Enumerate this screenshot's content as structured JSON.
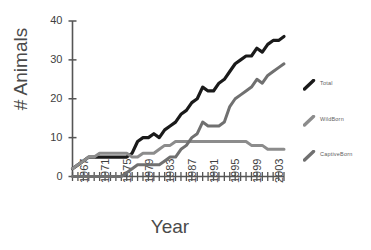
{
  "chart_data": {
    "type": "line",
    "title": "",
    "xlabel": "Year",
    "ylabel": "# Animals",
    "xlim": [
      1967,
      2006
    ],
    "ylim": [
      0,
      40
    ],
    "yticks": [
      0,
      10,
      20,
      30,
      40
    ],
    "xticks_labeled": [
      1967,
      1971,
      1975,
      1979,
      1983,
      1987,
      1991,
      1995,
      1999,
      2003
    ],
    "grid": false,
    "legend_position": "right",
    "x": [
      1967,
      1968,
      1969,
      1970,
      1971,
      1972,
      1973,
      1974,
      1975,
      1976,
      1977,
      1978,
      1979,
      1980,
      1981,
      1982,
      1983,
      1984,
      1985,
      1986,
      1987,
      1988,
      1989,
      1990,
      1991,
      1992,
      1993,
      1994,
      1995,
      1996,
      1997,
      1998,
      1999,
      2000,
      2001,
      2002,
      2003,
      2004,
      2005,
      2006
    ],
    "series": [
      {
        "name": "Total",
        "color": "#1a1a1a",
        "values": [
          2,
          3,
          4,
          5,
          5,
          5,
          5,
          5,
          5,
          5,
          5,
          6,
          9,
          10,
          10,
          11,
          10,
          12,
          13,
          14,
          16,
          17,
          19,
          20,
          23,
          22,
          22,
          24,
          25,
          27,
          29,
          30,
          31,
          31,
          33,
          32,
          34,
          35,
          35,
          36
        ]
      },
      {
        "name": "WildBorn",
        "color": "#8c8c8c",
        "values": [
          2,
          3,
          4,
          5,
          5,
          6,
          6,
          6,
          6,
          6,
          6,
          5,
          5,
          6,
          6,
          6,
          7,
          8,
          8,
          9,
          9,
          9,
          9,
          9,
          9,
          9,
          9,
          9,
          9,
          9,
          9,
          9,
          9,
          8,
          8,
          8,
          7,
          7,
          7,
          7
        ]
      },
      {
        "name": "CaptiveBorn",
        "color": "#707070",
        "values": [
          0,
          0,
          0,
          0,
          0,
          0,
          0,
          0,
          0,
          0,
          1,
          2,
          3,
          3,
          3,
          3,
          3,
          4,
          5,
          5,
          7,
          8,
          10,
          11,
          14,
          13,
          13,
          13,
          14,
          18,
          20,
          21,
          22,
          23,
          25,
          24,
          26,
          27,
          28,
          29
        ]
      }
    ]
  },
  "axes": {
    "ylabel": "# Animals",
    "xlabel": "Year"
  },
  "ytick_labels": [
    "40",
    "30",
    "20",
    "10",
    "0"
  ],
  "xtick_labels": [
    "1967",
    "1971",
    "1975",
    "1979",
    "1983",
    "1987",
    "1991",
    "1995",
    "1999",
    "2003"
  ],
  "legend": {
    "items": [
      {
        "label": "Total",
        "color": "#1a1a1a"
      },
      {
        "label": "WildBorn",
        "color": "#8c8c8c"
      },
      {
        "label": "CaptiveBorn",
        "color": "#707070"
      }
    ]
  }
}
